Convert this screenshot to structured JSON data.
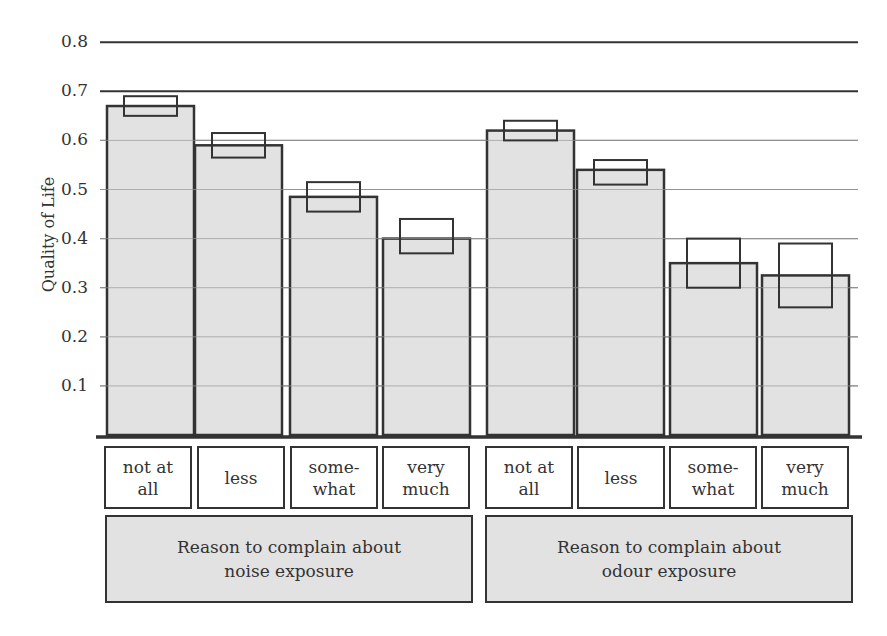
{
  "chart_data": {
    "type": "bar",
    "title": "",
    "xlabel": "",
    "ylabel": "Quality of Life",
    "ylim": [
      0,
      0.8
    ],
    "yticks": [
      "0.1",
      "0.2",
      "0.3",
      "0.4",
      "0.5",
      "0.6",
      "0.7",
      "0.8"
    ],
    "grid": true,
    "groups": [
      {
        "label": "Reason to complain about\nnoise exposure",
        "categories": [
          "not at\nall",
          "less",
          "some-\nwhat",
          "very\nmuch"
        ],
        "values": [
          0.67,
          0.59,
          0.485,
          0.4
        ],
        "ci_low": [
          0.65,
          0.565,
          0.455,
          0.37
        ],
        "ci_high": [
          0.69,
          0.615,
          0.515,
          0.44
        ]
      },
      {
        "label": "Reason to complain about\nodour exposure",
        "categories": [
          "not at\nall",
          "less",
          "some-\nwhat",
          "very\nmuch"
        ],
        "values": [
          0.62,
          0.54,
          0.35,
          0.325
        ],
        "ci_low": [
          0.6,
          0.51,
          0.3,
          0.26
        ],
        "ci_high": [
          0.64,
          0.56,
          0.4,
          0.39
        ]
      }
    ],
    "colors": {
      "bar_fill": "#e2e2e2",
      "bar_stroke": "#333333",
      "grid": "#888888",
      "axis": "#333333"
    }
  }
}
